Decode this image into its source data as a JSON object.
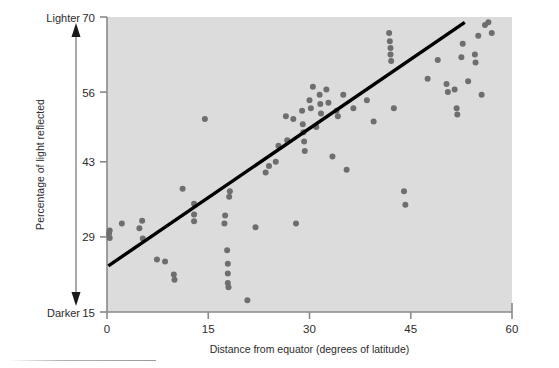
{
  "figure": {
    "background_color": "#ffffff",
    "plot_background_color": "#dcdcdc",
    "point_color": "#6e6e6e",
    "line_color": "#000000",
    "axis_color": "#8a8a8a",
    "text_color": "#2b2b2b"
  },
  "annotations": {
    "top_direction_label": "Lighter",
    "bottom_direction_label": "Darker",
    "direction_arrow": "double-headed-vertical-arrow"
  },
  "chart_data": {
    "type": "scatter",
    "title": "",
    "subtitle": "",
    "xlabel": "Distance from equator (degrees of latitude)",
    "ylabel": "Percentage of light reflected",
    "xlim": [
      0,
      60
    ],
    "ylim": [
      15,
      70
    ],
    "xticks": [
      0,
      15,
      30,
      45,
      60
    ],
    "xtick_labels": [
      "0",
      "15",
      "30",
      "45",
      "60"
    ],
    "yticks": [
      15,
      29,
      43,
      56,
      70
    ],
    "ytick_labels": [
      "15",
      "29",
      "43",
      "56",
      "70"
    ],
    "grid": false,
    "legend": null,
    "legend_position": "none",
    "point_marker": "circle",
    "series": [
      {
        "name": "Observations",
        "points": [
          [
            0.3,
            29.6
          ],
          [
            0.4,
            28.8
          ],
          [
            0.4,
            30.2
          ],
          [
            2.2,
            31.5
          ],
          [
            4.8,
            30.6
          ],
          [
            5.2,
            32.0
          ],
          [
            5.3,
            28.7
          ],
          [
            7.4,
            24.8
          ],
          [
            8.6,
            24.4
          ],
          [
            9.9,
            22.0
          ],
          [
            10.0,
            21.0
          ],
          [
            11.2,
            38.0
          ],
          [
            12.9,
            35.2
          ],
          [
            12.9,
            33.2
          ],
          [
            12.9,
            31.9
          ],
          [
            14.5,
            51.0
          ],
          [
            17.4,
            31.5
          ],
          [
            17.5,
            33.0
          ],
          [
            17.8,
            26.5
          ],
          [
            17.9,
            24.0
          ],
          [
            17.9,
            22.2
          ],
          [
            17.9,
            20.4
          ],
          [
            18.0,
            19.6
          ],
          [
            18.1,
            36.5
          ],
          [
            18.2,
            37.5
          ],
          [
            20.8,
            17.2
          ],
          [
            22.0,
            30.8
          ],
          [
            23.5,
            41.0
          ],
          [
            24.0,
            42.2
          ],
          [
            25.0,
            43.0
          ],
          [
            25.4,
            46.0
          ],
          [
            26.5,
            51.5
          ],
          [
            26.7,
            47.0
          ],
          [
            27.6,
            51.0
          ],
          [
            28.0,
            31.5
          ],
          [
            28.9,
            52.5
          ],
          [
            29.0,
            50.0
          ],
          [
            29.1,
            48.5
          ],
          [
            29.2,
            46.8
          ],
          [
            29.3,
            45.0
          ],
          [
            30.0,
            54.5
          ],
          [
            30.2,
            53.0
          ],
          [
            30.5,
            57.0
          ],
          [
            31.0,
            49.5
          ],
          [
            31.5,
            55.5
          ],
          [
            31.6,
            53.8
          ],
          [
            31.7,
            52.0
          ],
          [
            32.5,
            56.5
          ],
          [
            32.8,
            54.0
          ],
          [
            33.4,
            44.0
          ],
          [
            34.0,
            52.5
          ],
          [
            34.2,
            51.5
          ],
          [
            35.0,
            55.5
          ],
          [
            35.5,
            41.5
          ],
          [
            36.5,
            53.0
          ],
          [
            38.5,
            54.5
          ],
          [
            39.5,
            50.5
          ],
          [
            41.8,
            67.0
          ],
          [
            41.9,
            65.5
          ],
          [
            42.0,
            64.2
          ],
          [
            42.0,
            63.0
          ],
          [
            42.1,
            61.8
          ],
          [
            42.5,
            53.0
          ],
          [
            44.0,
            37.5
          ],
          [
            44.2,
            35.0
          ],
          [
            47.5,
            58.5
          ],
          [
            49.0,
            62.0
          ],
          [
            50.3,
            57.5
          ],
          [
            50.5,
            56.0
          ],
          [
            51.5,
            56.5
          ],
          [
            51.8,
            53.0
          ],
          [
            51.9,
            51.8
          ],
          [
            52.5,
            62.5
          ],
          [
            52.7,
            65.0
          ],
          [
            53.5,
            58.0
          ],
          [
            54.5,
            63.0
          ],
          [
            54.6,
            61.5
          ],
          [
            55.0,
            66.5
          ],
          [
            55.5,
            55.5
          ],
          [
            56.0,
            68.5
          ],
          [
            56.5,
            69.0
          ],
          [
            57.0,
            67.0
          ]
        ]
      }
    ],
    "trend_line": {
      "name": "Fitted regression line",
      "x_start": 0.2,
      "y_start": 23.6,
      "x_end": 53.0,
      "y_end": 69.0
    }
  }
}
